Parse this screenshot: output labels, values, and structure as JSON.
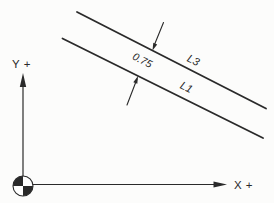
{
  "diagram": {
    "colors": {
      "background": "#fcfcfb",
      "ink": "#2a2a2a"
    },
    "axes": {
      "y_label": "Y +",
      "x_label": "X +"
    },
    "origin_symbol": "origin-target-icon",
    "lines": [
      {
        "label": "L3"
      },
      {
        "label": "L1"
      }
    ],
    "dimension": {
      "value": "0.75"
    }
  }
}
